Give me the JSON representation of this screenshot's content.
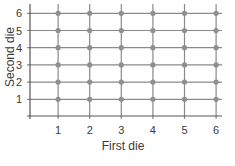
{
  "chart_data": {
    "type": "scatter",
    "title": "",
    "xlabel": "First die",
    "ylabel": "Second die",
    "x_ticks": [
      "1",
      "2",
      "3",
      "4",
      "5",
      "6"
    ],
    "y_ticks": [
      "1",
      "2",
      "3",
      "4",
      "5",
      "6"
    ],
    "xlim": [
      0,
      6.3
    ],
    "ylim": [
      0,
      6.3
    ],
    "grid": true,
    "legend": null,
    "points": [
      [
        1,
        1
      ],
      [
        2,
        1
      ],
      [
        3,
        1
      ],
      [
        4,
        1
      ],
      [
        5,
        1
      ],
      [
        6,
        1
      ],
      [
        1,
        2
      ],
      [
        2,
        2
      ],
      [
        3,
        2
      ],
      [
        4,
        2
      ],
      [
        5,
        2
      ],
      [
        6,
        2
      ],
      [
        1,
        3
      ],
      [
        2,
        3
      ],
      [
        3,
        3
      ],
      [
        4,
        3
      ],
      [
        5,
        3
      ],
      [
        6,
        3
      ],
      [
        1,
        4
      ],
      [
        2,
        4
      ],
      [
        3,
        4
      ],
      [
        4,
        4
      ],
      [
        5,
        4
      ],
      [
        6,
        4
      ],
      [
        1,
        5
      ],
      [
        2,
        5
      ],
      [
        3,
        5
      ],
      [
        4,
        5
      ],
      [
        5,
        5
      ],
      [
        6,
        5
      ],
      [
        1,
        6
      ],
      [
        2,
        6
      ],
      [
        3,
        6
      ],
      [
        4,
        6
      ],
      [
        5,
        6
      ],
      [
        6,
        6
      ]
    ],
    "colors": {
      "grid": "#8a8a8a",
      "point": "#8f8f8f",
      "axis": "#555555",
      "text": "#3a3a3a"
    }
  }
}
